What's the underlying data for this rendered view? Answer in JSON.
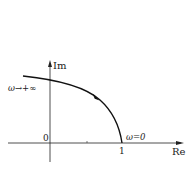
{
  "diagram": {
    "type": "nyquist-plot",
    "axes": {
      "x_label": "Re",
      "y_label": "Im",
      "origin_label": "0",
      "x_tick_label": "1"
    },
    "curve": {
      "start_label": "ω→+∞",
      "end_label": "ω=0",
      "direction": "from ω=0 at Re=1 toward ω→+∞ (arrow points toward decreasing... see arrow)",
      "color": "#111111"
    },
    "caption": ""
  }
}
